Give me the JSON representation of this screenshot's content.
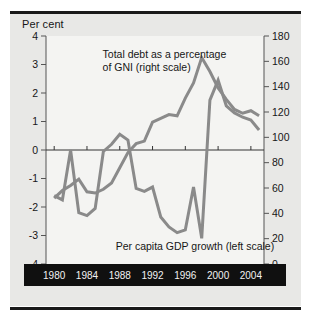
{
  "figure": {
    "units_label": "Per cent",
    "background": "#e8e8e6",
    "line_color": "#8a8a8a",
    "axis_color": "#555555",
    "xband_color": "#101010"
  },
  "chart_data": {
    "type": "line",
    "title": "",
    "xlabel": "",
    "ylabel": "Per cent",
    "grid": false,
    "legend_position": "inline-annotations",
    "x": [
      1980,
      1981,
      1982,
      1983,
      1984,
      1985,
      1986,
      1987,
      1988,
      1989,
      1990,
      1991,
      1992,
      1993,
      1994,
      1995,
      1996,
      1997,
      1998,
      1999,
      2000,
      2001,
      2002,
      2003,
      2004,
      2005
    ],
    "xticks": [
      1980,
      1984,
      1988,
      1992,
      1996,
      2000,
      2004
    ],
    "xlim": [
      1979,
      2005.6
    ],
    "left_axis": {
      "label": "Per cent",
      "ticks": [
        -4,
        -3,
        -2,
        -1,
        0,
        1,
        2,
        3,
        4
      ],
      "ylim": [
        -4,
        4
      ],
      "tick_labels": [
        "-4",
        "-3",
        "-2",
        "-1",
        "0",
        "1",
        "2",
        "3",
        "4"
      ]
    },
    "right_axis": {
      "label": "",
      "ticks": [
        0,
        20,
        40,
        60,
        80,
        100,
        120,
        140,
        160,
        180
      ],
      "ylim": [
        0,
        180
      ],
      "tick_labels": [
        "0",
        "20",
        "40",
        "60",
        "80",
        "100",
        "120",
        "140",
        "160",
        "180"
      ]
    },
    "series": [
      {
        "name": "Per capita GDP growth (left scale)",
        "axis": "left",
        "color": "#8a8a8a",
        "annotation": "Per capita GDP growth (left scale)",
        "values": [
          -1.6,
          -1.75,
          0.0,
          -2.2,
          -2.3,
          -2.05,
          -0.05,
          0.2,
          0.55,
          0.35,
          -1.35,
          -1.45,
          -1.3,
          -2.35,
          -2.7,
          -2.9,
          -2.8,
          -1.3,
          -3.1,
          1.75,
          2.45,
          1.55,
          1.3,
          1.15,
          1.05,
          0.7
        ]
      },
      {
        "name": "Total debt as a percentage of GNI (right scale)",
        "axis": "right",
        "color": "#8a8a8a",
        "annotation": "Total debt as a percentage of GNI (right scale)",
        "values": [
          52,
          58,
          62,
          67,
          57,
          56,
          59,
          64,
          76,
          88,
          95,
          97,
          112,
          115,
          118,
          117,
          131,
          143,
          163,
          152,
          139,
          130,
          122,
          119,
          121,
          117
        ]
      }
    ],
    "annotations": [
      {
        "name": "debt-annotation",
        "lines": [
          "Total debt as a percentage",
          "of GNI (right scale)"
        ],
        "x": 1985.9,
        "anchor": "start"
      },
      {
        "name": "gdp-annotation",
        "lines": [
          "Per capita GDP growth (left scale)"
        ],
        "x": 1987.5,
        "anchor": "start"
      }
    ]
  }
}
